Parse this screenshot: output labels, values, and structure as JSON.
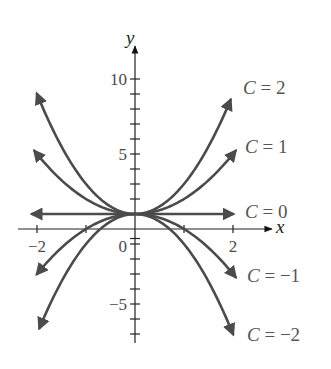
{
  "chart_data": {
    "type": "line",
    "title": "",
    "xlabel": "x",
    "ylabel": "y",
    "xlim": [
      -2.3,
      2.7
    ],
    "ylim": [
      -8,
      11.5
    ],
    "grid": false,
    "x_ticks": [
      -2,
      -1,
      0,
      1,
      2
    ],
    "x_tick_labels": [
      {
        "value": -2,
        "label": "−2"
      },
      {
        "value": 0,
        "label": "0"
      },
      {
        "value": 2,
        "label": "2"
      }
    ],
    "y_ticks": [
      -7,
      -6,
      -5,
      -4,
      -3,
      -2,
      -1,
      0,
      1,
      2,
      3,
      4,
      5,
      6,
      7,
      8,
      9,
      10
    ],
    "y_tick_labels": [
      {
        "value": 10,
        "label": "10"
      },
      {
        "value": 5,
        "label": "5"
      },
      {
        "value": -5,
        "label": "−5"
      }
    ],
    "formula": "y = C x^2 + 1",
    "series": [
      {
        "name": "C = 2",
        "C": 2,
        "x_range": [
          -2.0,
          1.95
        ],
        "label": {
          "text_c": "C",
          "text_rest": " = 2"
        }
      },
      {
        "name": "C = 1",
        "C": 1,
        "x_range": [
          -2.05,
          2.05
        ],
        "label": {
          "text_c": "C",
          "text_rest": " = 1"
        }
      },
      {
        "name": "C = 0",
        "C": 0,
        "x_range": [
          -2.1,
          2.0
        ],
        "label": {
          "text_c": "C",
          "text_rest": " = 0"
        }
      },
      {
        "name": "C = −1",
        "C": -1,
        "x_range": [
          -2.0,
          2.05
        ],
        "label": {
          "text_c": "C",
          "text_rest": " = −1"
        }
      },
      {
        "name": "C = −2",
        "C": -2,
        "x_range": [
          -1.95,
          2.0
        ],
        "label": {
          "text_c": "C",
          "text_rest": " = −2"
        }
      }
    ],
    "legend_position": "right, at curve ends"
  },
  "layout": {
    "origin_px": [
      135,
      229
    ],
    "x_scale_px": 49,
    "y_scale_px": 15,
    "curve_color": "#4b4b4b",
    "axis_color": "#222222",
    "label_positions": [
      [
        243,
        94
      ],
      [
        245,
        153
      ],
      [
        245,
        218
      ],
      [
        247,
        282
      ],
      [
        247,
        341
      ]
    ]
  }
}
